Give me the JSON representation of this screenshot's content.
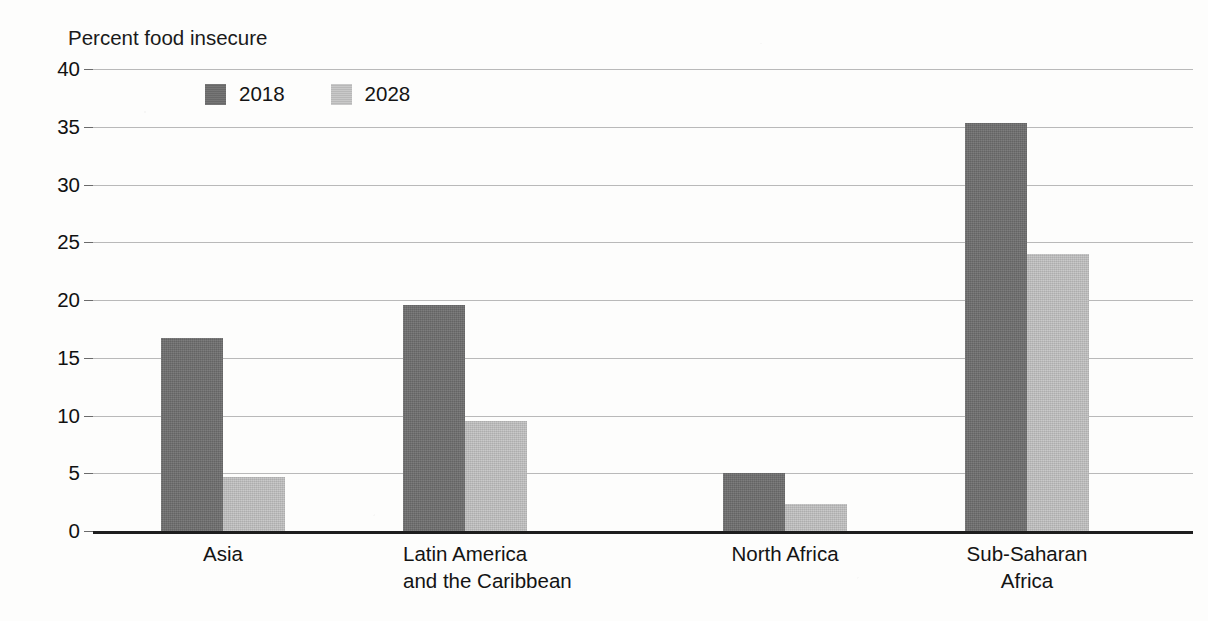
{
  "chart_data": {
    "type": "bar",
    "title": "",
    "axis_title": "Percent food insecure",
    "xlabel": "",
    "ylabel": "Percent food insecure",
    "ylim": [
      0,
      40
    ],
    "ytick_values": [
      40,
      35,
      30,
      25,
      20,
      15,
      10,
      5,
      0
    ],
    "ytick_labels": [
      "40",
      "35",
      "30",
      "25",
      "20",
      "15",
      "10",
      "5",
      "0"
    ],
    "grid": true,
    "legend_position": "top-left-inside",
    "categories": [
      "Asia",
      "Latin America and the Caribbean",
      "North Africa",
      "Sub-Saharan Africa"
    ],
    "category_lines": [
      [
        "Asia"
      ],
      [
        "Latin America",
        "and the Caribbean"
      ],
      [
        "North Africa"
      ],
      [
        "Sub-Saharan",
        "Africa"
      ]
    ],
    "series": [
      {
        "name": "2018",
        "color": "#6e6e6e",
        "values": [
          16.7,
          19.6,
          5.0,
          35.3
        ]
      },
      {
        "name": "2028",
        "color": "#bdbdbd",
        "values": [
          4.7,
          9.5,
          2.3,
          24.0
        ]
      }
    ]
  },
  "legend": {
    "items": [
      {
        "label": "2018",
        "swatch": "dark-gray-swatch-icon"
      },
      {
        "label": "2028",
        "swatch": "light-gray-swatch-icon"
      }
    ]
  },
  "colors": {
    "series_2018": "#6e6e6e",
    "series_2028": "#bdbdbd",
    "gridline": "#b9b9b9",
    "axis": "#1e1e1e",
    "text": "#141414",
    "background": "#fdfdfc"
  }
}
